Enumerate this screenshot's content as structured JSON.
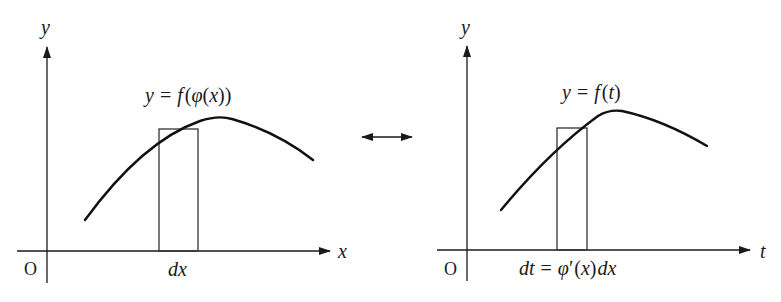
{
  "left_panel": {
    "y_axis_label": "y",
    "x_axis_label": "x",
    "origin_label": "O",
    "curve_label": {
      "y": "y",
      "eq": "=",
      "f": "f",
      "open": "(",
      "phi": "φ",
      "open2": "(",
      "x": "x",
      "close": "))"
    },
    "strip_label": "dx"
  },
  "connector": {
    "symbol": "double-headed-arrow"
  },
  "right_panel": {
    "y_axis_label": "y",
    "x_axis_label": "t",
    "origin_label": "O",
    "curve_label": {
      "y": "y",
      "eq": "=",
      "f": "f",
      "open": "(",
      "t": "t",
      "close": ")"
    },
    "strip_label": {
      "dt": "dt",
      "eq": "=",
      "phi": "φ",
      "prime": "′",
      "open": "(",
      "x": "x",
      "close": ")",
      "dx": "dx"
    }
  },
  "colors": {
    "ink": "#1a1a1a",
    "background": "#ffffff"
  }
}
